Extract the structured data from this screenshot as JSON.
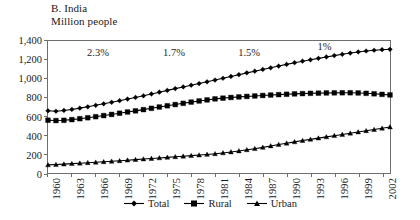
{
  "figure": {
    "title": "B. India",
    "subtitle": "Million people"
  },
  "legend": {
    "position": "bottom-center",
    "items": [
      {
        "label": "Total",
        "marker": "diamond-marker-icon",
        "color": "#000000"
      },
      {
        "label": "Rural",
        "marker": "square-marker-icon",
        "color": "#000000"
      },
      {
        "label": "Urban",
        "marker": "triangle-marker-icon",
        "color": "#000000"
      }
    ]
  },
  "chart_data": {
    "type": "line",
    "title": "B. India",
    "subtitle": "Million people",
    "xlabel": "",
    "ylabel": "Million people",
    "ylim": [
      0,
      1400
    ],
    "xlim": [
      1960,
      2003
    ],
    "grid": false,
    "legend_position": "bottom-center",
    "ytick_labels": [
      "0",
      "200",
      "400",
      "600",
      "800",
      "1,000",
      "1,200",
      "1,400"
    ],
    "ytick_values": [
      0,
      200,
      400,
      600,
      800,
      1000,
      1200,
      1400
    ],
    "xtick_labels": [
      "1960",
      "1963",
      "1966",
      "1969",
      "1972",
      "1975",
      "1978",
      "1981",
      "1984",
      "1987",
      "1990",
      "1993",
      "1996",
      "1999",
      "2002"
    ],
    "xtick_values": [
      1960,
      1963,
      1966,
      1969,
      1972,
      1975,
      1978,
      1981,
      1984,
      1987,
      1990,
      1993,
      1996,
      1999,
      2002
    ],
    "x": [
      1960,
      1961,
      1962,
      1963,
      1964,
      1965,
      1966,
      1967,
      1968,
      1969,
      1970,
      1971,
      1972,
      1973,
      1974,
      1975,
      1976,
      1977,
      1978,
      1979,
      1980,
      1981,
      1982,
      1983,
      1984,
      1985,
      1986,
      1987,
      1988,
      1989,
      1990,
      1991,
      1992,
      1993,
      1994,
      1995,
      1996,
      1997,
      1998,
      1999,
      2000,
      2001,
      2002,
      2003
    ],
    "series": [
      {
        "name": "Total",
        "marker": "diamond",
        "color": "#000000",
        "values": [
          660,
          655,
          663,
          674,
          688,
          702,
          718,
          734,
          750,
          767,
          784,
          801,
          819,
          838,
          857,
          876,
          895,
          913,
          931,
          949,
          967,
          986,
          1005,
          1024,
          1043,
          1062,
          1080,
          1098,
          1116,
          1134,
          1152,
          1170,
          1186,
          1201,
          1216,
          1231,
          1245,
          1259,
          1272,
          1284,
          1294,
          1302,
          1308,
          1312
        ]
      },
      {
        "name": "Rural",
        "marker": "square",
        "color": "#000000",
        "values": [
          560,
          556,
          559,
          566,
          576,
          586,
          597,
          609,
          621,
          634,
          647,
          659,
          672,
          686,
          700,
          713,
          726,
          739,
          752,
          764,
          775,
          786,
          794,
          801,
          807,
          812,
          817,
          822,
          827,
          831,
          835,
          839,
          842,
          845,
          847,
          849,
          850,
          851,
          851,
          849,
          845,
          840,
          834,
          828
        ]
      },
      {
        "name": "Urban",
        "marker": "triangle",
        "color": "#000000",
        "values": [
          86,
          90,
          94,
          99,
          104,
          109,
          114,
          119,
          124,
          130,
          136,
          142,
          148,
          154,
          160,
          166,
          172,
          178,
          184,
          190,
          197,
          204,
          213,
          223,
          234,
          246,
          258,
          272,
          287,
          302,
          316,
          330,
          344,
          357,
          370,
          383,
          396,
          409,
          422,
          435,
          448,
          461,
          474,
          488
        ]
      }
    ],
    "annotations": [
      {
        "text": "2.3%",
        "x_year": 1965.0,
        "y_value": 1260
      },
      {
        "text": "1.7%",
        "x_year": 1974.5,
        "y_value": 1260
      },
      {
        "text": "1.5%",
        "x_year": 1983.9,
        "y_value": 1260
      },
      {
        "text": "1%",
        "x_year": 1993.8,
        "y_value": 1330
      }
    ]
  }
}
